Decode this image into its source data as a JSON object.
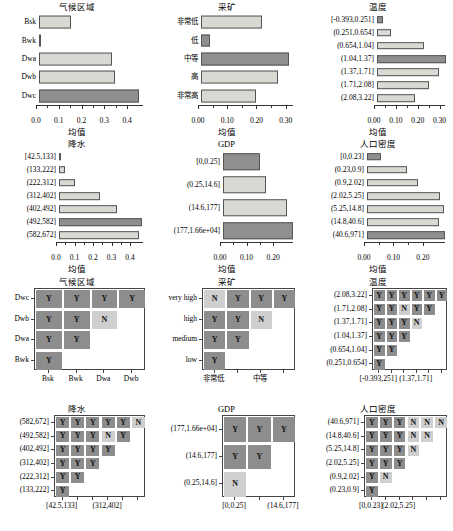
{
  "figure": {
    "axis_label": "均值",
    "rows": 4,
    "cols": 3
  },
  "chart_data": [
    {
      "id": "climate-zone-bars",
      "type": "bar",
      "orientation": "horizontal",
      "title": "气候区域",
      "xlabel": "均值",
      "ylabel": "",
      "categories": [
        "Bsk",
        "Bwk",
        "Dwa",
        "Dwb",
        "Dwc"
      ],
      "values": [
        0.141,
        0.004,
        0.322,
        0.332,
        0.441
      ],
      "highlight": [
        false,
        false,
        false,
        false,
        true
      ],
      "xlim": [
        0,
        0.47
      ],
      "xticks": [
        0.0,
        0.1,
        0.2,
        0.3,
        0.4
      ],
      "xticklabels": [
        "0.0",
        "0.1",
        "0.2",
        "0.3",
        "0.4"
      ],
      "grid": false
    },
    {
      "id": "mining-bars",
      "type": "bar",
      "orientation": "horizontal",
      "title": "采矿",
      "xlabel": "均值",
      "ylabel": "",
      "categories": [
        "非常低",
        "低",
        "中等",
        "高",
        "非常高"
      ],
      "values": [
        0.208,
        0.031,
        0.301,
        0.265,
        0.188
      ],
      "highlight": [
        false,
        true,
        true,
        false,
        false
      ],
      "xlim": [
        0,
        0.325
      ],
      "xticks": [
        0.0,
        0.1,
        0.2,
        0.3
      ],
      "xticklabels": [
        "0.00",
        "0.10",
        "0.20",
        "0.30"
      ],
      "grid": false
    },
    {
      "id": "temperature-bars",
      "type": "bar",
      "orientation": "horizontal",
      "title": "温度",
      "xlabel": "均值",
      "ylabel": "",
      "categories": [
        "[-0.393,0.251]",
        "(0.251,0.654]",
        "(0.654,1.04]",
        "(1.04,1.37]",
        "(1.37,1.71]",
        "(1.71,2.08]",
        "(2.08,3.22]"
      ],
      "values": [
        0.026,
        0.063,
        0.216,
        0.314,
        0.283,
        0.238,
        0.172
      ],
      "highlight": [
        true,
        false,
        false,
        true,
        false,
        false,
        false
      ],
      "xlim": [
        0,
        0.325
      ],
      "xticks": [
        0.0,
        0.1,
        0.2,
        0.3
      ],
      "xticklabels": [
        "0.00",
        "0.10",
        "0.20",
        "0.30"
      ],
      "grid": false
    },
    {
      "id": "precipitation-bars",
      "type": "bar",
      "orientation": "horizontal",
      "title": "降水",
      "xlabel": "均值",
      "ylabel": "",
      "categories": [
        "[42.5,133]",
        "(133,222]",
        "(222,312]",
        "(312,402]",
        "(402,492]",
        "(492,582]",
        "(582,672]"
      ],
      "values": [
        0.012,
        0.033,
        0.084,
        0.223,
        0.311,
        0.447,
        0.431
      ],
      "highlight": [
        true,
        false,
        false,
        false,
        false,
        true,
        false
      ],
      "xlim": [
        0,
        0.47
      ],
      "xticks": [
        0.0,
        0.1,
        0.2,
        0.3,
        0.4
      ],
      "xticklabels": [
        "0.0",
        "0.1",
        "0.2",
        "0.3",
        "0.4"
      ],
      "grid": false
    },
    {
      "id": "gdp-bars",
      "type": "bar",
      "orientation": "horizontal",
      "title": "GDP",
      "xlabel": "均值",
      "ylabel": "",
      "categories": [
        "[0,0.25]",
        "(0.25,14.6]",
        "(14.6,177]",
        "(177,1.66e+04]"
      ],
      "values": [
        0.138,
        0.163,
        0.241,
        0.262
      ],
      "highlight": [
        true,
        false,
        false,
        true
      ],
      "xlim": [
        0,
        0.275
      ],
      "xticks": [
        0.0,
        0.1,
        0.2
      ],
      "xticklabels": [
        "0.00",
        "0.10",
        "0.20"
      ],
      "grid": false
    },
    {
      "id": "population-density-bars",
      "type": "bar",
      "orientation": "horizontal",
      "title": "人口密度",
      "xlabel": "均值",
      "ylabel": "",
      "categories": [
        "[0,0.23]",
        "(0.23,0.9]",
        "(0.9,2.02]",
        "(2.02,5.25]",
        "(5.25,14.8]",
        "(14.8,40.6]",
        "(40.6,971]"
      ],
      "values": [
        0.046,
        0.137,
        0.172,
        0.247,
        0.262,
        0.244,
        0.265
      ],
      "highlight": [
        true,
        false,
        false,
        false,
        false,
        false,
        true
      ],
      "xlim": [
        0,
        0.275
      ],
      "xticks": [
        0.0,
        0.1,
        0.2
      ],
      "xticklabels": [
        "0.00",
        "0.10",
        "0.20"
      ],
      "grid": false
    },
    {
      "id": "climate-zone-matrix",
      "type": "heatmap",
      "title": "气候区域",
      "xlabel": "",
      "ylabel": "",
      "x_categories": [
        "Bsk",
        "Bwk",
        "Dwa",
        "Dwb"
      ],
      "y_categories": [
        "Bwk",
        "Dwa",
        "Dwb",
        "Dwc"
      ],
      "x_tick_shown": [
        "Bsk",
        "Bwk",
        "Dwa",
        "Dwb"
      ],
      "cells": [
        [
          "Y",
          "",
          "",
          ""
        ],
        [
          "Y",
          "Y",
          "",
          ""
        ],
        [
          "Y",
          "Y",
          "N",
          ""
        ],
        [
          "Y",
          "Y",
          "Y",
          "Y"
        ]
      ]
    },
    {
      "id": "mining-matrix",
      "type": "heatmap",
      "title": "采矿",
      "xlabel": "",
      "ylabel": "",
      "x_categories": [
        "非常低",
        "低",
        "中等",
        "高"
      ],
      "y_categories": [
        "low",
        "medium",
        "high",
        "very high"
      ],
      "x_tick_shown": [
        "非常低",
        "中等"
      ],
      "cells": [
        [
          "Y",
          "",
          "",
          ""
        ],
        [
          "Y",
          "Y",
          "",
          ""
        ],
        [
          "Y",
          "Y",
          "N",
          ""
        ],
        [
          "N",
          "Y",
          "Y",
          "Y"
        ]
      ]
    },
    {
      "id": "temperature-matrix",
      "type": "heatmap",
      "title": "温度",
      "xlabel": "",
      "ylabel": "",
      "x_categories": [
        "[-0.393,251]",
        "(0.251,0.654]",
        "(0.654,1.04]",
        "(1.37,1.71]",
        "(1.37,1.71]",
        "(1.71,2.08]"
      ],
      "y_categories": [
        "(0.251,0.654]",
        "(0.654,1.04]",
        "(1.04,1.37]",
        "(1.37,1.71]",
        "(1.71,2.08]",
        "(2.08,3.22]"
      ],
      "x_tick_shown": [
        "[-0.393,251]",
        "(1.37,1.71]"
      ],
      "cells": [
        [
          "Y",
          "",
          "",
          "",
          "",
          ""
        ],
        [
          "Y",
          "Y",
          "",
          "",
          "",
          ""
        ],
        [
          "Y",
          "Y",
          "Y",
          "",
          "",
          ""
        ],
        [
          "Y",
          "Y",
          "Y",
          "N",
          "",
          ""
        ],
        [
          "Y",
          "Y",
          "N",
          "Y",
          "Y",
          ""
        ],
        [
          "Y",
          "Y",
          "Y",
          "Y",
          "Y",
          "Y"
        ]
      ]
    },
    {
      "id": "precipitation-matrix",
      "type": "heatmap",
      "title": "降水",
      "xlabel": "",
      "ylabel": "",
      "x_categories": [
        "[42.5,133]",
        "(133,222]",
        "(222,312]",
        "(312,402]",
        "(402,492]",
        "(492,582]"
      ],
      "y_categories": [
        "(133,222]",
        "(222,312]",
        "(312,402]",
        "(402,492]",
        "(492,582]",
        "(582,672]"
      ],
      "x_tick_shown": [
        "[42.5,133]",
        "(312,402]"
      ],
      "cells": [
        [
          "Y",
          "",
          "",
          "",
          "",
          ""
        ],
        [
          "Y",
          "Y",
          "",
          "",
          "",
          ""
        ],
        [
          "Y",
          "Y",
          "Y",
          "",
          "",
          ""
        ],
        [
          "Y",
          "Y",
          "Y",
          "Y",
          "",
          ""
        ],
        [
          "Y",
          "Y",
          "Y",
          "N",
          "Y",
          ""
        ],
        [
          "Y",
          "Y",
          "Y",
          "Y",
          "Y",
          "N"
        ]
      ]
    },
    {
      "id": "gdp-matrix",
      "type": "heatmap",
      "title": "GDP",
      "xlabel": "",
      "ylabel": "",
      "x_categories": [
        "[0,0.25]",
        "(0.25,14.6]",
        "(14.6,177]"
      ],
      "y_categories": [
        "(0.25,14.6]",
        "(14.6,177]",
        "(177,1.66e+04]"
      ],
      "x_tick_shown": [
        "[0,0.25]",
        "(14.6,177]"
      ],
      "cells": [
        [
          "N",
          "",
          ""
        ],
        [
          "Y",
          "Y",
          ""
        ],
        [
          "Y",
          "Y",
          "Y"
        ]
      ]
    },
    {
      "id": "population-density-matrix",
      "type": "heatmap",
      "title": "人口密度",
      "xlabel": "",
      "ylabel": "",
      "x_categories": [
        "[0,0.23]",
        "(0.23,0.9]",
        "(2.02,5.25]",
        "(2.02,5.25]",
        "(5.25,14.8]",
        "(14.8,40.6]"
      ],
      "y_categories": [
        "(0.23,0.9]",
        "(0.9,2.02]",
        "(2.02,5.25]",
        "(5.25,14.8]",
        "(14.8,40.6]",
        "(40.6,971]"
      ],
      "x_tick_shown": [
        "[0,0.23]",
        "(2.02,5.25]"
      ],
      "cells": [
        [
          "Y",
          "",
          "",
          "",
          "",
          ""
        ],
        [
          "Y",
          "N",
          "",
          "",
          "",
          ""
        ],
        [
          "Y",
          "Y",
          "Y",
          "",
          "",
          ""
        ],
        [
          "Y",
          "Y",
          "Y",
          "N",
          "",
          ""
        ],
        [
          "Y",
          "Y",
          "Y",
          "N",
          "N",
          ""
        ],
        [
          "Y",
          "Y",
          "Y",
          "N",
          "N",
          "N"
        ]
      ]
    }
  ]
}
